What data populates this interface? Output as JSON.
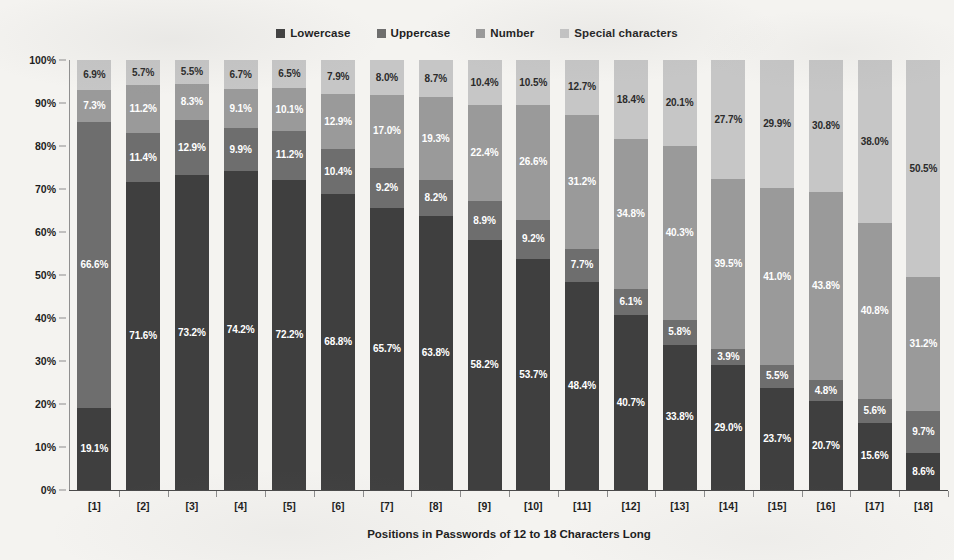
{
  "chart_data": {
    "type": "bar",
    "subtype": "stacked-bar-100-percent",
    "title": "",
    "xlabel": "Positions in Passwords of 12 to 18 Characters Long",
    "ylabel": "Percentage of Character Types",
    "ylim": [
      0,
      100
    ],
    "ytick_labels": [
      "0%",
      "10%",
      "20%",
      "30%",
      "40%",
      "50%",
      "60%",
      "70%",
      "80%",
      "90%",
      "100%"
    ],
    "ytick_values": [
      0,
      10,
      20,
      30,
      40,
      50,
      60,
      70,
      80,
      90,
      100
    ],
    "grid": false,
    "legend_position": "top-center",
    "categories": [
      "[1]",
      "[2]",
      "[3]",
      "[4]",
      "[5]",
      "[6]",
      "[7]",
      "[8]",
      "[9]",
      "[10]",
      "[11]",
      "[12]",
      "[13]",
      "[14]",
      "[15]",
      "[16]",
      "[17]",
      "[18]"
    ],
    "series": [
      {
        "name": "Lowercase",
        "color": "#3f3f3f",
        "label_color": "on-dark",
        "values": [
          19.1,
          71.6,
          73.2,
          74.2,
          72.2,
          68.8,
          65.7,
          63.8,
          58.2,
          53.7,
          48.4,
          40.7,
          33.8,
          29.0,
          23.7,
          20.7,
          15.6,
          8.6
        ],
        "labels": [
          "19.1%",
          "71.6%",
          "73.2%",
          "74.2%",
          "72.2%",
          "68.8%",
          "65.7%",
          "63.8%",
          "58.2%",
          "53.7%",
          "48.4%",
          "40.7%",
          "33.8%",
          "29.0%",
          "23.7%",
          "20.7%",
          "15.6%",
          "8.6%"
        ]
      },
      {
        "name": "Uppercase",
        "color": "#6e6e6e",
        "label_color": "on-dark",
        "values": [
          66.6,
          11.4,
          12.9,
          9.9,
          11.2,
          10.4,
          9.2,
          8.2,
          8.9,
          9.2,
          7.7,
          6.1,
          5.8,
          3.9,
          5.5,
          4.8,
          5.6,
          9.7
        ],
        "labels": [
          "66.6%",
          "11.4%",
          "12.9%",
          "9.9%",
          "11.2%",
          "10.4%",
          "9.2%",
          "8.2%",
          "8.9%",
          "9.2%",
          "7.7%",
          "6.1%",
          "5.8%",
          "3.9%",
          "5.5%",
          "4.8%",
          "5.6%",
          "9.7%"
        ]
      },
      {
        "name": "Number",
        "color": "#9a9a9a",
        "label_color": "on-dark",
        "values": [
          7.3,
          11.2,
          8.3,
          9.1,
          10.1,
          12.9,
          17.0,
          19.3,
          22.4,
          26.6,
          31.2,
          34.8,
          40.3,
          39.5,
          41.0,
          43.8,
          40.8,
          31.2
        ],
        "labels": [
          "7.3%",
          "11.2%",
          "8.3%",
          "9.1%",
          "10.1%",
          "12.9%",
          "17.0%",
          "19.3%",
          "22.4%",
          "26.6%",
          "31.2%",
          "34.8%",
          "40.3%",
          "39.5%",
          "41.0%",
          "43.8%",
          "40.8%",
          "31.2%"
        ]
      },
      {
        "name": "Special characters",
        "color": "#c6c6c6",
        "label_color": "on-light",
        "values": [
          6.9,
          5.7,
          5.5,
          6.7,
          6.5,
          7.9,
          8.0,
          8.7,
          10.4,
          10.5,
          12.7,
          18.4,
          20.1,
          27.7,
          29.9,
          30.8,
          38.0,
          50.5
        ],
        "labels": [
          "6.9%",
          "5.7%",
          "5.5%",
          "6.7%",
          "6.5%",
          "7.9%",
          "8.0%",
          "8.7%",
          "10.4%",
          "10.5%",
          "12.7%",
          "18.4%",
          "20.1%",
          "27.7%",
          "29.9%",
          "30.8%",
          "38.0%",
          "50.5%"
        ]
      }
    ]
  },
  "legend": {
    "entries": [
      {
        "label": "Lowercase",
        "color": "#3f3f3f"
      },
      {
        "label": "Uppercase",
        "color": "#6e6e6e"
      },
      {
        "label": "Number",
        "color": "#9a9a9a"
      },
      {
        "label": "Special characters",
        "color": "#c6c6c6"
      }
    ]
  },
  "axes": {
    "y_title": "Percentage of Character Types",
    "x_title": "Positions in Passwords of 12 to 18 Characters Long"
  }
}
